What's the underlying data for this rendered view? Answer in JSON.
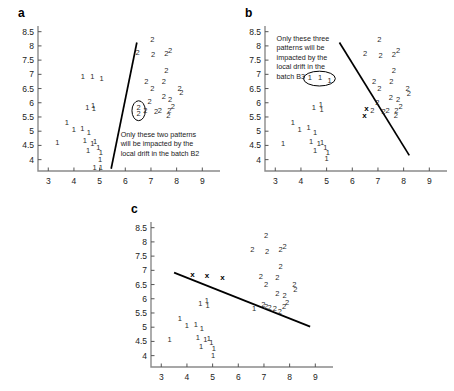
{
  "figure": {
    "panels": [
      {
        "id": "a",
        "label": "a",
        "annotation": "Only these two patterns\nwill be impacted by the\nlocal drift in the batch B2",
        "highlight_shape": "ellipse",
        "highlight_count": 2
      },
      {
        "id": "b",
        "label": "b",
        "annotation": "Only these three\npatterns will be\nimpacted by the\nlocal drift in the\nbatch B3",
        "highlight_shape": "ellipse",
        "highlight_count": 3
      },
      {
        "id": "c",
        "label": "c",
        "annotation": "",
        "highlight_shape": "none",
        "highlight_count": 0
      }
    ]
  },
  "chart_data": [
    {
      "type": "scatter",
      "panel": "a",
      "title": "a",
      "xlabel": "",
      "ylabel": "",
      "xlim": [
        2.6,
        9.3
      ],
      "ylim": [
        3.6,
        8.7
      ],
      "xticks": [
        3,
        4,
        5,
        6,
        7,
        8,
        9
      ],
      "yticks": [
        4,
        4.5,
        5,
        5.5,
        6,
        6.5,
        7,
        7.5,
        8,
        8.5
      ],
      "grid": false,
      "legend": "none",
      "series": [
        {
          "name": "1",
          "label": "1",
          "points": [
            [
              4.35,
              6.92
            ],
            [
              4.72,
              6.92
            ],
            [
              5.08,
              6.82
            ],
            [
              4.52,
              5.83
            ],
            [
              4.75,
              5.9
            ],
            [
              4.78,
              5.78
            ],
            [
              3.72,
              5.3
            ],
            [
              4.0,
              5.05
            ],
            [
              4.33,
              5.08
            ],
            [
              4.58,
              4.95
            ],
            [
              3.35,
              4.58
            ],
            [
              4.42,
              4.65
            ],
            [
              4.72,
              4.55
            ],
            [
              4.82,
              4.62
            ],
            [
              4.55,
              4.3
            ],
            [
              4.95,
              4.42
            ],
            [
              5.05,
              4.25
            ],
            [
              5.02,
              4.0
            ],
            [
              4.8,
              3.72
            ],
            [
              5.05,
              3.72
            ]
          ]
        },
        {
          "name": "2",
          "label": "2",
          "points": [
            [
              7.05,
              8.2
            ],
            [
              6.48,
              7.75
            ],
            [
              7.08,
              7.68
            ],
            [
              7.6,
              7.7
            ],
            [
              7.75,
              7.82
            ],
            [
              7.6,
              7.1
            ],
            [
              6.82,
              6.72
            ],
            [
              7.5,
              6.72
            ],
            [
              7.05,
              6.5
            ],
            [
              8.12,
              6.48
            ],
            [
              8.18,
              6.35
            ],
            [
              7.5,
              6.2
            ],
            [
              7.75,
              6.1
            ],
            [
              6.95,
              6.02
            ],
            [
              6.78,
              5.72
            ],
            [
              7.2,
              5.68
            ],
            [
              7.35,
              5.7
            ],
            [
              7.72,
              5.72
            ],
            [
              7.85,
              5.85
            ],
            [
              6.52,
              5.82
            ],
            [
              6.52,
              5.6
            ],
            [
              7.68,
              5.55
            ]
          ]
        }
      ],
      "decision_boundary": {
        "x1": 5.45,
        "y1": 3.68,
        "x2": 6.45,
        "y2": 8.12
      },
      "highlight_ellipse": {
        "cx": 6.52,
        "cy": 5.72,
        "rx": 0.26,
        "ry": 0.35
      },
      "annotation": {
        "text": "Only these two patterns\nwill be impacted by the\nlocal drift in the batch B2",
        "x": 5.82,
        "y": 5.05
      },
      "x_markers": []
    },
    {
      "type": "scatter",
      "panel": "b",
      "title": "b",
      "xlabel": "",
      "ylabel": "",
      "xlim": [
        2.6,
        9.3
      ],
      "ylim": [
        3.6,
        8.7
      ],
      "xticks": [
        3,
        4,
        5,
        6,
        7,
        8,
        9
      ],
      "yticks": [
        4,
        4.5,
        5,
        5.5,
        6,
        6.5,
        7,
        7.5,
        8,
        8.5
      ],
      "grid": false,
      "legend": "none",
      "series": [
        {
          "name": "1",
          "label": "1",
          "points": [
            [
              4.35,
              6.88
            ],
            [
              4.75,
              6.88
            ],
            [
              5.12,
              6.78
            ],
            [
              4.5,
              5.82
            ],
            [
              4.78,
              5.92
            ],
            [
              4.8,
              5.75
            ],
            [
              3.68,
              5.3
            ],
            [
              3.95,
              5.05
            ],
            [
              4.3,
              5.1
            ],
            [
              4.55,
              4.95
            ],
            [
              3.3,
              4.55
            ],
            [
              4.4,
              4.62
            ],
            [
              4.7,
              4.55
            ],
            [
              4.82,
              4.6
            ],
            [
              4.55,
              4.3
            ],
            [
              4.95,
              4.42
            ],
            [
              5.05,
              4.25
            ],
            [
              5.0,
              4.02
            ]
          ]
        },
        {
          "name": "2",
          "label": "2",
          "points": [
            [
              7.05,
              8.2
            ],
            [
              6.5,
              7.72
            ],
            [
              7.1,
              7.65
            ],
            [
              7.62,
              7.68
            ],
            [
              7.78,
              7.82
            ],
            [
              7.62,
              7.1
            ],
            [
              6.85,
              6.72
            ],
            [
              7.52,
              6.72
            ],
            [
              7.05,
              6.5
            ],
            [
              8.15,
              6.48
            ],
            [
              8.2,
              6.32
            ],
            [
              7.5,
              6.18
            ],
            [
              7.78,
              6.1
            ],
            [
              6.98,
              6.0
            ],
            [
              6.78,
              5.72
            ],
            [
              7.22,
              5.68
            ],
            [
              7.38,
              5.7
            ],
            [
              7.72,
              5.72
            ],
            [
              7.88,
              5.85
            ],
            [
              7.7,
              5.55
            ]
          ]
        }
      ],
      "decision_boundary": {
        "x1": 5.5,
        "y1": 8.12,
        "x2": 8.22,
        "y2": 4.15
      },
      "highlight_ellipse": {
        "cx": 4.72,
        "cy": 6.85,
        "rx": 0.62,
        "ry": 0.26
      },
      "annotation": {
        "text": "Only these three\npatterns will be\nimpacted by the\nlocal drift in the\nbatch B3",
        "x": 3.05,
        "y": 8.42
      },
      "x_markers": [
        [
          6.55,
          5.78
        ],
        [
          6.48,
          5.55
        ]
      ]
    },
    {
      "type": "scatter",
      "panel": "c",
      "title": "c",
      "xlabel": "",
      "ylabel": "",
      "xlim": [
        2.6,
        9.3
      ],
      "ylim": [
        3.6,
        8.7
      ],
      "xticks": [
        3,
        4,
        5,
        6,
        7,
        8,
        9
      ],
      "yticks": [
        4,
        4.5,
        5,
        5.5,
        6,
        6.5,
        7,
        7.5,
        8,
        8.5
      ],
      "grid": false,
      "legend": "none",
      "series": [
        {
          "name": "1",
          "label": "1",
          "points": [
            [
              4.52,
              5.82
            ],
            [
              4.78,
              5.92
            ],
            [
              4.8,
              5.75
            ],
            [
              3.72,
              5.28
            ],
            [
              4.0,
              5.05
            ],
            [
              4.35,
              5.08
            ],
            [
              4.58,
              4.95
            ],
            [
              3.32,
              4.55
            ],
            [
              4.42,
              4.62
            ],
            [
              4.72,
              4.55
            ],
            [
              4.85,
              4.6
            ],
            [
              4.55,
              4.3
            ],
            [
              4.95,
              4.45
            ],
            [
              5.05,
              4.25
            ],
            [
              5.02,
              4.0
            ],
            [
              6.62,
              5.65
            ]
          ]
        },
        {
          "name": "2",
          "label": "2",
          "points": [
            [
              7.08,
              8.2
            ],
            [
              6.55,
              7.72
            ],
            [
              7.12,
              7.65
            ],
            [
              7.65,
              7.7
            ],
            [
              7.8,
              7.82
            ],
            [
              7.65,
              7.12
            ],
            [
              6.88,
              6.75
            ],
            [
              7.52,
              6.72
            ],
            [
              7.08,
              6.5
            ],
            [
              8.18,
              6.48
            ],
            [
              8.22,
              6.32
            ],
            [
              7.52,
              6.18
            ],
            [
              7.8,
              6.1
            ],
            [
              6.98,
              5.78
            ],
            [
              7.08,
              5.72
            ],
            [
              7.22,
              5.68
            ],
            [
              7.42,
              5.65
            ],
            [
              7.78,
              5.72
            ],
            [
              7.9,
              5.85
            ],
            [
              7.62,
              5.55
            ]
          ]
        }
      ],
      "decision_boundary": {
        "x1": 3.5,
        "y1": 6.92,
        "x2": 8.8,
        "y2": 5.02
      },
      "highlight_ellipse": null,
      "annotation": {
        "text": "",
        "x": 0,
        "y": 0
      },
      "x_markers": [
        [
          4.22,
          6.82
        ],
        [
          4.78,
          6.8
        ],
        [
          5.38,
          6.72
        ]
      ]
    }
  ]
}
